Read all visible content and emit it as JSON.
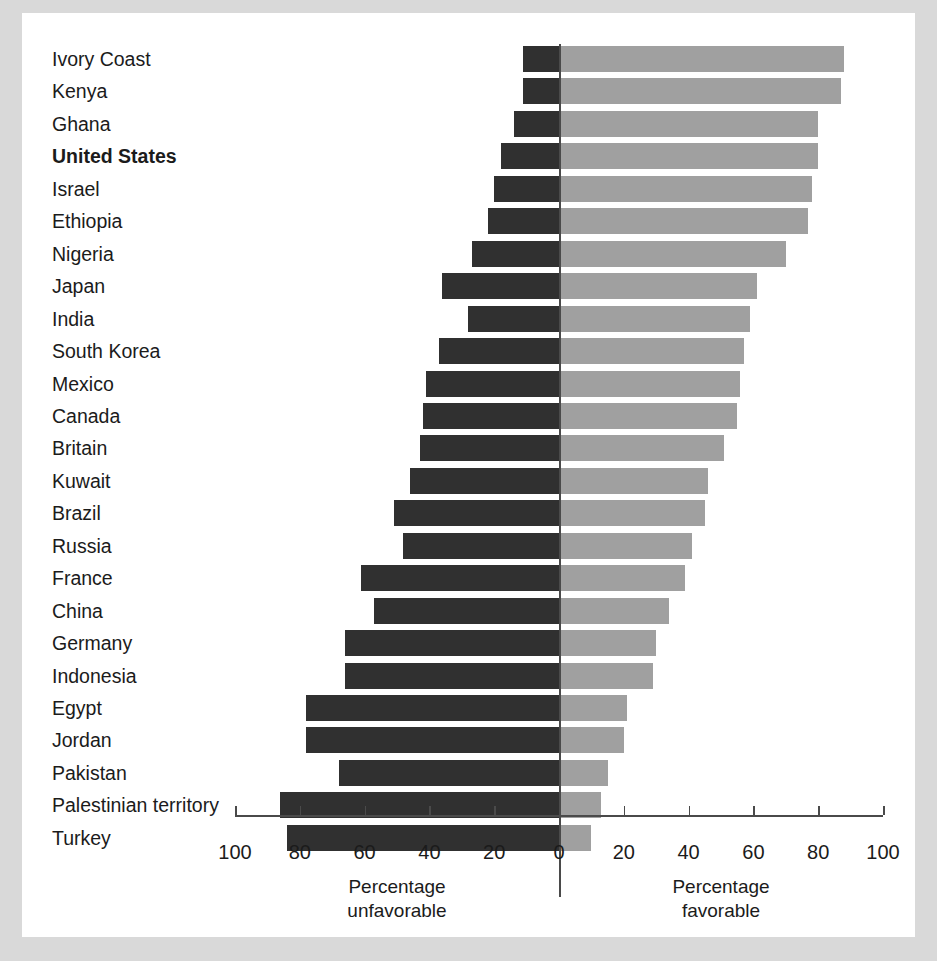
{
  "chart_data": {
    "type": "bar",
    "orientation": "horizontal-diverging",
    "title": "",
    "subtitle": "",
    "xlabel_left": "Percentage unfavorable",
    "xlabel_right": "Percentage favorable",
    "ylabel": "",
    "grid": false,
    "legend": null,
    "xlim": [
      -100,
      100
    ],
    "xticks_left": [
      "100",
      "80",
      "60",
      "40",
      "20"
    ],
    "xtick_zero": "0",
    "xticks_right": [
      "20",
      "40",
      "60",
      "80",
      "100"
    ],
    "xticks_all": [
      100,
      80,
      60,
      40,
      20,
      0,
      20,
      40,
      60,
      80,
      100
    ],
    "xtick_step": 20,
    "highlight_category": "United States",
    "categories": [
      "Ivory Coast",
      "Kenya",
      "Ghana",
      "United States",
      "Israel",
      "Ethiopia",
      "Nigeria",
      "Japan",
      "India",
      "South Korea",
      "Mexico",
      "Canada",
      "Britain",
      "Kuwait",
      "Brazil",
      "Russia",
      "France",
      "China",
      "Germany",
      "Indonesia",
      "Egypt",
      "Jordan",
      "Pakistan",
      "Palestinian territory",
      "Turkey"
    ],
    "series": [
      {
        "name": "Percentage unfavorable",
        "color": "#303030",
        "direction": "left",
        "values": [
          11,
          11,
          14,
          18,
          20,
          22,
          27,
          36,
          28,
          37,
          41,
          42,
          43,
          46,
          51,
          48,
          61,
          57,
          66,
          66,
          78,
          78,
          68,
          86,
          84
        ]
      },
      {
        "name": "Percentage favorable",
        "color": "#a0a0a0",
        "direction": "right",
        "values": [
          88,
          87,
          80,
          80,
          78,
          77,
          70,
          61,
          59,
          57,
          56,
          55,
          51,
          46,
          45,
          41,
          39,
          34,
          30,
          29,
          21,
          20,
          15,
          13,
          10
        ]
      }
    ]
  },
  "colors": {
    "page_background": "#d9d9d9",
    "card_background": "#ffffff",
    "unfavorable_bar": "#303030",
    "favorable_bar": "#a0a0a0",
    "axis": "#4a4a4a",
    "text": "#1b1b1b"
  }
}
